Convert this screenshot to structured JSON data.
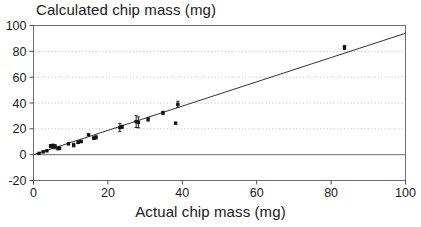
{
  "chart_data": {
    "type": "scatter",
    "title": "Calculated chip mass (mg)",
    "xlabel": "Actual chip mass (mg)",
    "ylabel": "",
    "xlim": [
      0,
      100
    ],
    "ylim": [
      -20,
      100
    ],
    "xticks": [
      0,
      20,
      40,
      60,
      80,
      100
    ],
    "yticks": [
      -20,
      0,
      20,
      40,
      60,
      80,
      100
    ],
    "xtick_labels": [
      "0",
      "20",
      "40",
      "60",
      "80",
      "100"
    ],
    "ytick_labels": [
      "-20",
      "0",
      "20",
      "40",
      "60",
      "80",
      "100"
    ],
    "grid": "horizontal-dotted",
    "grid_values": [
      20,
      40,
      60,
      80
    ],
    "zero_line": 0,
    "legend": "none",
    "marker": "filled-square",
    "marker_color": "#111111",
    "line_color": "#333333",
    "points": [
      {
        "x": 1.5,
        "y": 1.0,
        "yerr": 0.0
      },
      {
        "x": 2.6,
        "y": 2.2,
        "yerr": 0.0
      },
      {
        "x": 3.6,
        "y": 3.0,
        "yerr": 0.0
      },
      {
        "x": 4.6,
        "y": 6.6,
        "yerr": 1.2
      },
      {
        "x": 5.2,
        "y": 6.8,
        "yerr": 1.4
      },
      {
        "x": 5.8,
        "y": 6.2,
        "yerr": 1.6
      },
      {
        "x": 6.6,
        "y": 4.8,
        "yerr": 1.0
      },
      {
        "x": 7.0,
        "y": 5.0,
        "yerr": 0.8
      },
      {
        "x": 9.4,
        "y": 8.4,
        "yerr": 0.0
      },
      {
        "x": 10.8,
        "y": 7.4,
        "yerr": 1.4
      },
      {
        "x": 12.0,
        "y": 9.6,
        "yerr": 1.0
      },
      {
        "x": 12.8,
        "y": 10.2,
        "yerr": 0.8
      },
      {
        "x": 14.8,
        "y": 15.4,
        "yerr": 0.0
      },
      {
        "x": 16.2,
        "y": 12.8,
        "yerr": 1.0
      },
      {
        "x": 16.8,
        "y": 13.4,
        "yerr": 1.2
      },
      {
        "x": 23.2,
        "y": 21.0,
        "yerr": 3.2
      },
      {
        "x": 23.8,
        "y": 21.6,
        "yerr": 1.2
      },
      {
        "x": 27.6,
        "y": 25.6,
        "yerr": 4.6
      },
      {
        "x": 28.2,
        "y": 25.0,
        "yerr": 4.2
      },
      {
        "x": 30.8,
        "y": 27.4,
        "yerr": 1.4
      },
      {
        "x": 34.8,
        "y": 32.4,
        "yerr": 1.2
      },
      {
        "x": 38.2,
        "y": 24.4,
        "yerr": 0.0
      },
      {
        "x": 38.8,
        "y": 39.0,
        "yerr": 2.4
      },
      {
        "x": 83.6,
        "y": 83.0,
        "yerr": 1.6
      }
    ],
    "fit_line": {
      "x0": 0,
      "y0": 0.0,
      "x1": 100,
      "y1": 94.0
    }
  }
}
